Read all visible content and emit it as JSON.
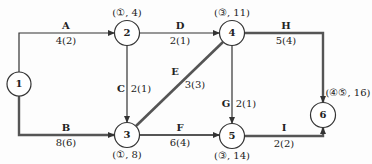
{
  "diagram": {
    "type": "activity-on-arrow network (critical path)",
    "colors": {
      "line": "#333333",
      "critical_line": "#555555",
      "node_fill": "#ffffff",
      "text": "#222222"
    },
    "nodes": [
      {
        "id": "1",
        "label": "1",
        "x": 19,
        "y": 84,
        "annotation": ""
      },
      {
        "id": "2",
        "label": "2",
        "x": 127,
        "y": 33,
        "annotation": "(①, 4)"
      },
      {
        "id": "3",
        "label": "3",
        "x": 127,
        "y": 135,
        "annotation": "(①, 8)"
      },
      {
        "id": "4",
        "label": "4",
        "x": 232,
        "y": 33,
        "annotation": "(③, 11)"
      },
      {
        "id": "5",
        "label": "5",
        "x": 232,
        "y": 136,
        "annotation": "(③, 14)"
      },
      {
        "id": "6",
        "label": "6",
        "x": 323,
        "y": 115,
        "annotation": "(④⑤, 16)"
      }
    ],
    "edges": [
      {
        "name": "A",
        "from": "1",
        "to": "2",
        "value": "4(2)",
        "critical": false
      },
      {
        "name": "B",
        "from": "1",
        "to": "3",
        "value": "8(6)",
        "critical": true
      },
      {
        "name": "C",
        "from": "2",
        "to": "3",
        "value": "2(1)",
        "critical": false
      },
      {
        "name": "D",
        "from": "2",
        "to": "4",
        "value": "2(1)",
        "critical": false
      },
      {
        "name": "E",
        "from": "3",
        "to": "4",
        "value": "3(3)",
        "critical": true
      },
      {
        "name": "F",
        "from": "3",
        "to": "5",
        "value": "6(4)",
        "critical": true
      },
      {
        "name": "G",
        "from": "4",
        "to": "5",
        "value": "2(1)",
        "critical": false
      },
      {
        "name": "H",
        "from": "4",
        "to": "6",
        "value": "5(4)",
        "critical": true
      },
      {
        "name": "I",
        "from": "5",
        "to": "6",
        "value": "2(2)",
        "critical": true
      }
    ]
  }
}
